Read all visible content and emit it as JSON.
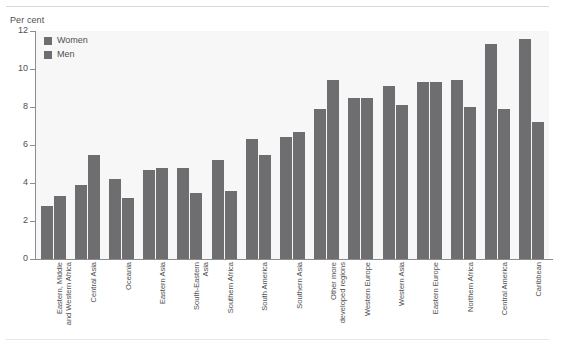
{
  "chart_data": {
    "type": "bar",
    "title": "",
    "subtitle": "",
    "ylabel": "Per cent",
    "xlabel": "",
    "ylim": [
      0,
      12
    ],
    "yticks": [
      0,
      2,
      4,
      6,
      8,
      10,
      12
    ],
    "grid": false,
    "legend_position": "top-left",
    "legend": [
      "Women",
      "Men"
    ],
    "categories": [
      "Eastern, Middle\nand Western Africa",
      "Central Asia",
      "Oceania",
      "Eastern Asia",
      "South-Eastern\nAsia",
      "Southern Africa",
      "South America",
      "Southern Asia",
      "Other more\ndeveloped regions",
      "Western Europe",
      "Western Asia",
      "Eastern Europe",
      "Northern Africa",
      "Central America",
      "Caribbean"
    ],
    "series": [
      {
        "name": "Women",
        "color": "#6e6e70",
        "values": [
          2.8,
          3.9,
          4.2,
          4.7,
          4.8,
          5.2,
          6.3,
          6.4,
          7.9,
          8.5,
          9.1,
          9.3,
          9.4,
          11.3,
          11.6
        ]
      },
      {
        "name": "Men",
        "color": "#6e6e70",
        "values": [
          3.3,
          5.5,
          3.2,
          4.8,
          3.5,
          3.6,
          5.5,
          6.7,
          9.4,
          8.5,
          8.1,
          9.3,
          8.0,
          7.9,
          7.2
        ]
      }
    ]
  },
  "colors": {
    "bar": "#6e6e70",
    "plot_background": "#f7f7f7",
    "axis": "#8c8c8e",
    "text": "#4f4f51"
  }
}
